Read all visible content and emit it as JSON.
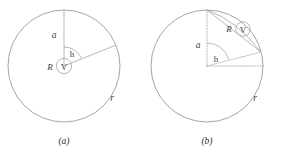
{
  "figure": {
    "title": "",
    "panels": [
      {
        "key": "a",
        "caption": "(a)",
        "labels": {
          "outer_radius": "r",
          "inner_radius": "R",
          "meter": "V",
          "vertical_segment": "a",
          "angle": "h"
        },
        "geometry": {
          "outer_circle": {
            "cx": 64,
            "cy": 66,
            "r": 56
          },
          "inner_circle": {
            "cx": 64,
            "cy": 66,
            "r": 7.5
          },
          "vertical_line": {
            "x1": 64,
            "y1": 66,
            "x2": 64,
            "y2": 10
          },
          "slant_line": {
            "x1": 64,
            "y1": 66,
            "x2": 116,
            "y2": 45
          },
          "angle_arc_radius": 19
        }
      },
      {
        "key": "b",
        "caption": "(b)",
        "labels": {
          "outer_radius": "r",
          "inner_radius": "R",
          "meter": "V",
          "vertical_segment": "a",
          "angle": "h"
        },
        "geometry": {
          "outer_circle": {
            "cx": 207,
            "cy": 66,
            "r": 56
          },
          "vertical_line": {
            "x1": 207,
            "y1": 66,
            "x2": 207,
            "y2": 10
          },
          "horizontal_line": {
            "x1": 207,
            "y1": 66,
            "x2": 263,
            "y2": 66
          },
          "chord_line": {
            "x1": 207,
            "y1": 10,
            "x2": 261,
            "y2": 52
          },
          "angle_arc_radius": 23
        }
      }
    ]
  },
  "colors": {
    "line": "#8d8d8d",
    "dotted": "#a5a5a5",
    "text": "#3c3c3c",
    "background": "#ffffff"
  }
}
